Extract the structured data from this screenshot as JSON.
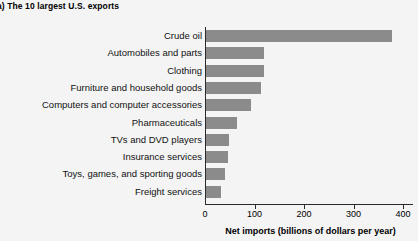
{
  "title": "a) The 10 largest U.S. exports",
  "colors": {
    "bar": "#8b8b8b",
    "axis": "#2b2b2b",
    "background": "#f4f4f4",
    "text": "#000000"
  },
  "chart_data": {
    "type": "bar",
    "orientation": "horizontal",
    "title": "a) The 10 largest U.S. exports",
    "xlabel": "Net imports (billions of dollars per year)",
    "ylabel": "",
    "xlim": [
      0,
      420
    ],
    "xticks": [
      0,
      100,
      200,
      300,
      400
    ],
    "xticklabels": [
      "0",
      "100",
      "200",
      "300",
      "400"
    ],
    "grid": false,
    "legend": false,
    "categories": [
      "Crude oil",
      "Automobiles and parts",
      "Clothing",
      "Furniture and household goods",
      "Computers and computer accessories",
      "Pharmaceuticals",
      "TVs and DVD players",
      "Insurance services",
      "Toys, games, and sporting goods",
      "Freight services"
    ],
    "values": [
      376,
      117,
      118,
      112,
      90,
      62,
      47,
      44,
      38,
      30
    ],
    "series": [
      {
        "name": "Net imports",
        "values": [
          376,
          117,
          118,
          112,
          90,
          62,
          47,
          44,
          38,
          30
        ]
      }
    ]
  }
}
